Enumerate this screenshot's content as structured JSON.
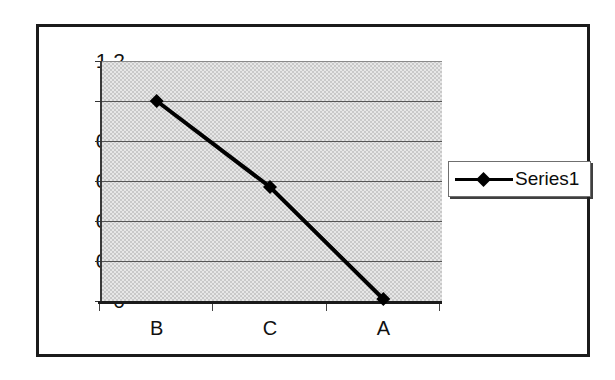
{
  "chart_data": {
    "type": "line",
    "title": "",
    "subtitle": "",
    "xlabel": "",
    "ylabel": "",
    "categories": [
      "B",
      "C",
      "A"
    ],
    "series": [
      {
        "name": "Series1",
        "values": [
          1.0,
          0.57,
          0.01
        ],
        "marker": "diamond",
        "color": "#000000"
      }
    ],
    "ylim": [
      0,
      1.2
    ],
    "y_ticks": [
      "1.2",
      "1",
      "0.8",
      "0.6",
      "0.4",
      "0.2",
      "0"
    ],
    "y_tick_values": [
      1.2,
      1,
      0.8,
      0.6,
      0.4,
      0.2,
      0
    ],
    "grid": true,
    "grid_axis": "y",
    "legend_position": "right",
    "plot_background": "#c9c9c9",
    "chart_background": "#ffffff",
    "border_color": "#1b1b1b"
  },
  "legend": {
    "entries": [
      {
        "label": "Series1",
        "marker": "diamond-marker-icon"
      }
    ]
  },
  "axes": {
    "x_categories": [
      "B",
      "C",
      "A"
    ],
    "y_tick_labels": [
      "1.2",
      "1",
      "0.8",
      "0.6",
      "0.4",
      "0.2",
      "0"
    ]
  }
}
